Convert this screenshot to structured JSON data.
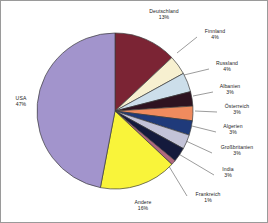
{
  "chart_data": {
    "type": "pie",
    "title": "",
    "legend_position": "callout-labels",
    "grid": false,
    "value_suffix": "%",
    "categories": [
      "Deutschland",
      "Finnland",
      "Russland",
      "Albanien",
      "Österreich",
      "Algerien",
      "Großbritanien",
      "India",
      "Frankreich",
      "Andere",
      "USA"
    ],
    "values": [
      13,
      4,
      4,
      3,
      3,
      3,
      3,
      3,
      1,
      16,
      47
    ],
    "slices": [
      {
        "label": "Deutschland",
        "value": 13,
        "value_text": "13%",
        "color": "#7b2434",
        "label_x": 140,
        "label_y": 7,
        "label_w": 46,
        "leader": null
      },
      {
        "label": "Finnland",
        "value": 4,
        "value_text": "4%",
        "color": "#f7f0d0",
        "label_x": 196,
        "label_y": 27,
        "label_w": 36,
        "leader": [
          [
            196,
            36
          ],
          [
            176,
            52
          ]
        ]
      },
      {
        "label": "Russland",
        "value": 4,
        "value_text": "4%",
        "color": "#ccdeea",
        "label_x": 208,
        "label_y": 59,
        "label_w": 36,
        "leader": [
          [
            208,
            68
          ],
          [
            183,
            74
          ]
        ]
      },
      {
        "label": "Albanien",
        "value": 3,
        "value_text": "3%",
        "color": "#2e1320",
        "label_x": 212,
        "label_y": 82,
        "label_w": 34,
        "leader": [
          [
            212,
            91
          ],
          [
            192,
            95
          ]
        ]
      },
      {
        "label": "Österreich",
        "value": 3,
        "value_text": "3%",
        "color": "#ef8b5e",
        "label_x": 216,
        "label_y": 102,
        "label_w": 40,
        "leader": [
          [
            216,
            111
          ],
          [
            194,
            110
          ]
        ]
      },
      {
        "label": "Algerien",
        "value": 3,
        "value_text": "3%",
        "color": "#1f3a7a",
        "label_x": 215,
        "label_y": 122,
        "label_w": 34,
        "leader": [
          [
            215,
            131
          ],
          [
            191,
            125
          ]
        ]
      },
      {
        "label": "Großbritanien",
        "value": 3,
        "value_text": "3%",
        "color": "#c3c3d8",
        "label_x": 211,
        "label_y": 143,
        "label_w": 50,
        "leader": [
          [
            211,
            152
          ],
          [
            185,
            140
          ]
        ]
      },
      {
        "label": "India",
        "value": 3,
        "value_text": "3%",
        "color": "#141a3c",
        "label_x": 213,
        "label_y": 165,
        "label_w": 28,
        "leader": [
          [
            213,
            174
          ],
          [
            176,
            152
          ]
        ]
      },
      {
        "label": "Frankreich",
        "value": 1,
        "value_text": "1%",
        "color": "#b0697e",
        "label_x": 186,
        "label_y": 190,
        "label_w": 42,
        "leader": [
          [
            186,
            195
          ],
          [
            166,
            162
          ]
        ]
      },
      {
        "label": "Andere",
        "value": 16,
        "value_text": "16%",
        "color": "#f9f43a",
        "label_x": 124,
        "label_y": 198,
        "label_w": 36,
        "leader": null
      },
      {
        "label": "USA",
        "value": 47,
        "value_text": "47%",
        "color": "#a294cc",
        "label_x": 6,
        "label_y": 94,
        "label_w": 28,
        "leader": null
      }
    ]
  },
  "frame": {
    "border_color": "#9a9a9a",
    "background": "#ffffff"
  },
  "pie": {
    "center_x": 114,
    "center_y": 110,
    "radius": 78,
    "start_angle_deg": -90,
    "outline_color": "#3c3c3c"
  }
}
